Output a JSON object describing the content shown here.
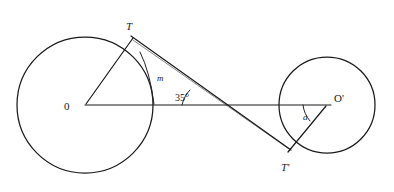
{
  "figure": {
    "type": "geometry-diagram",
    "background_color": "#ffffff",
    "stroke_color": "#1a1a1a"
  },
  "labels": {
    "left_center": "0",
    "right_center": "O'",
    "tangent_point_left": "T",
    "tangent_point_right": "T'",
    "segment_m": "m",
    "angle_35": "35°",
    "angle_alpha": "a"
  },
  "geometry": {
    "left_circle": {
      "cx": 85,
      "cy": 105,
      "r": 68
    },
    "right_circle": {
      "cx": 327,
      "cy": 105,
      "r": 48
    },
    "center_line": {
      "x1": 85,
      "y1": 105,
      "x2": 327,
      "y2": 105
    },
    "tangent_line": {
      "x1": 133,
      "y1": 38,
      "x2": 288,
      "y2": 148
    },
    "radius_left": {
      "x1": 85,
      "y1": 105,
      "x2": 133,
      "y2": 38
    },
    "radius_right": {
      "x1": 327,
      "y1": 105,
      "x2": 288,
      "y2": 148
    },
    "tangent_horizontal_intersection": {
      "x": 200,
      "y": 105
    }
  },
  "measures": {
    "angle_at_center_line_deg": 35,
    "angle_alpha_label": "a"
  }
}
